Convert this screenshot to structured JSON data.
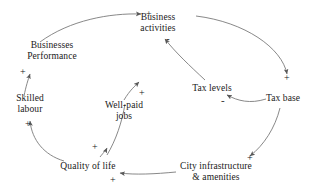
{
  "diagram": {
    "type": "causal-loop-diagram",
    "title": "",
    "background_color": "#ffffff",
    "stroke_color": "#6b6b6b",
    "text_color": "#191919",
    "nodes": [
      {
        "id": "business-activities",
        "label_lines": [
          "Business",
          "activities"
        ],
        "x": 158,
        "y": 20
      },
      {
        "id": "businesses-performance",
        "label_lines": [
          "Businesses",
          "Performance"
        ],
        "x": 52,
        "y": 55
      },
      {
        "id": "skilled-labour",
        "label_lines": [
          "Skilled",
          "labour"
        ],
        "x": 28,
        "y": 103
      },
      {
        "id": "well-paid-jobs",
        "label_lines": [
          "Well-paid",
          "jobs"
        ],
        "x": 123,
        "y": 108
      },
      {
        "id": "tax-levels",
        "label_lines": [
          "Tax levels"
        ],
        "x": 212,
        "y": 88
      },
      {
        "id": "tax-base",
        "label_lines": [
          "Tax base"
        ],
        "x": 283,
        "y": 98
      },
      {
        "id": "quality-of-life",
        "label_lines": [
          "Quality of life"
        ],
        "x": 88,
        "y": 166
      },
      {
        "id": "city-infrastructure",
        "label_lines": [
          "City infrastructure",
          "& amenities"
        ],
        "x": 215,
        "y": 166
      }
    ],
    "links": [
      {
        "id": "link-performance-to-activities",
        "from": "businesses-performance",
        "to": "business-activities",
        "polarity": "+"
      },
      {
        "id": "link-activities-to-taxbase",
        "from": "business-activities",
        "to": "tax-base",
        "polarity": "+"
      },
      {
        "id": "link-taxbase-to-taxlevels",
        "from": "tax-base",
        "to": "tax-levels",
        "polarity": "-"
      },
      {
        "id": "link-taxlevels-to-activities",
        "from": "tax-levels",
        "to": "business-activities",
        "polarity": "-"
      },
      {
        "id": "link-wellpaidjobs-to-activities",
        "from": "well-paid-jobs",
        "to": "business-activities",
        "polarity": "+"
      },
      {
        "id": "link-qualityoflife-to-wellpaidjobs",
        "from": "quality-of-life",
        "to": "well-paid-jobs",
        "polarity": "+"
      },
      {
        "id": "link-skilledlabour-to-performance",
        "from": "skilled-labour",
        "to": "businesses-performance",
        "polarity": "+"
      },
      {
        "id": "link-qualityoflife-to-skilledlabour",
        "from": "quality-of-life",
        "to": "skilled-labour",
        "polarity": "+"
      },
      {
        "id": "link-cityinfra-to-qualityoflife",
        "from": "city-infrastructure",
        "to": "quality-of-life",
        "polarity": "+"
      },
      {
        "id": "link-taxbase-to-cityinfra",
        "from": "tax-base",
        "to": "city-infrastructure",
        "polarity": "+"
      }
    ],
    "polarity_marks": [
      {
        "id": "sign-activities-in-left",
        "text": "+",
        "x": 146,
        "y": 13,
        "link": "link-performance-to-activities"
      },
      {
        "id": "sign-activities-in-taxlevels",
        "text": "-",
        "x": 165,
        "y": 37,
        "link": "link-taxlevels-to-activities"
      },
      {
        "id": "sign-performance-in",
        "text": "+",
        "x": 22,
        "y": 71,
        "link": "link-skilledlabour-to-performance"
      },
      {
        "id": "sign-skilledlabour-in",
        "text": "+",
        "x": 27,
        "y": 123,
        "link": "link-qualityoflife-to-skilledlabour"
      },
      {
        "id": "sign-wellpaidjobs-out",
        "text": "+",
        "x": 138,
        "y": 92,
        "link": "link-wellpaidjobs-to-activities"
      },
      {
        "id": "sign-taxlevels-in",
        "text": "-",
        "x": 222,
        "y": 99,
        "link": "link-taxbase-to-taxlevels"
      },
      {
        "id": "sign-taxbase-in",
        "text": "+",
        "x": 283,
        "y": 77,
        "link": "link-activities-to-taxbase"
      },
      {
        "id": "sign-qualityoflife-in-top",
        "text": "+",
        "x": 93,
        "y": 146,
        "link": "link-qualityoflife-to-wellpaidjobs"
      },
      {
        "id": "sign-qualityoflife-in-bottom",
        "text": "+",
        "x": 111,
        "y": 179,
        "link": "link-cityinfra-to-qualityoflife"
      },
      {
        "id": "sign-cityinfra-in",
        "text": "+",
        "x": 248,
        "y": 157,
        "link": "link-taxbase-to-cityinfra"
      }
    ]
  }
}
